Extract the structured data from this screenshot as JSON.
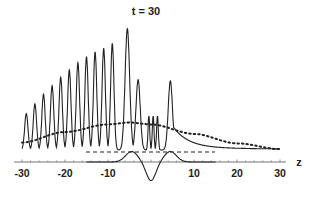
{
  "chart_data": {
    "type": "line",
    "title": "t = 30",
    "xlabel": "z",
    "ylabel": "",
    "xlim": [
      -30,
      30
    ],
    "xticks": [
      -30,
      -20,
      -10,
      10,
      20,
      30
    ],
    "xtick_labels": [
      "-30",
      "-20",
      "-10",
      "10",
      "20",
      "30"
    ],
    "grid": false,
    "legend": null,
    "series": [
      {
        "name": "oscillating wave (solid)",
        "style": "solid",
        "description": "Oscillation with growing amplitude from z=-30 to z≈-7, large peak near z≈-5.5, secondary peaks near z≈-3 and z≈4.5, rapid small oscillations near z≈-1..2, then monotone decay to baseline by z=30",
        "peaks_z": [
          -29,
          -27,
          -25,
          -23,
          -21,
          -19,
          -17,
          -15,
          -13,
          -11,
          -9,
          -5.5,
          -3,
          -0.5,
          0.5,
          1.5,
          4.5
        ],
        "peaks_height_rel": [
          0.3,
          0.38,
          0.46,
          0.53,
          0.6,
          0.66,
          0.72,
          0.77,
          0.81,
          0.84,
          0.88,
          1.0,
          0.58,
          0.28,
          0.28,
          0.28,
          0.57
        ]
      },
      {
        "name": "envelope (dotted)",
        "style": "dotted",
        "description": "Broad hump rising from z=-30, maximum near z≈-5, decaying toward z=30",
        "z": [
          -30,
          -20,
          -10,
          -5,
          0,
          10,
          20,
          30
        ],
        "height_rel": [
          0.09,
          0.2,
          0.28,
          0.3,
          0.28,
          0.18,
          0.08,
          0.02
        ]
      },
      {
        "name": "reference level (dashed)",
        "style": "dashed",
        "z_range": [
          -15,
          15
        ],
        "height_rel": 0.0
      },
      {
        "name": "localized profile (solid, lower)",
        "style": "solid",
        "description": "Zero outside |z|<8; positive bumps at z≈±4.5, negative dip at z=0",
        "z": [
          -15,
          -8,
          -4.5,
          0,
          4.5,
          8,
          15
        ],
        "values_rel": [
          0,
          0,
          0.35,
          -0.65,
          0.35,
          0,
          0
        ]
      }
    ]
  },
  "labels": {
    "title": "t = 30",
    "xlabel": "z",
    "ticks": [
      "-30",
      "-20",
      "-10",
      "10",
      "20",
      "30"
    ]
  }
}
